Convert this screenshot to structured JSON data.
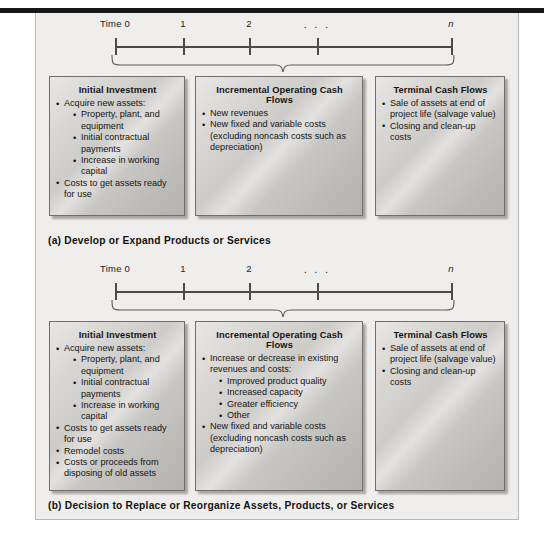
{
  "figure": {
    "timeline": {
      "ticks": [
        {
          "label": "Time 0",
          "x": 114,
          "italic": false,
          "dots": false
        },
        {
          "label": "1",
          "x": 182,
          "italic": false,
          "dots": false
        },
        {
          "label": "2",
          "x": 248,
          "italic": false,
          "dots": false
        },
        {
          "label": ". . .",
          "x": 316,
          "italic": false,
          "dots": true
        },
        {
          "label": "n",
          "x": 450,
          "italic": true,
          "dots": false
        }
      ]
    },
    "panels": [
      {
        "id": "a",
        "caption": "(a) Develop or Expand Products or Services",
        "boxes": [
          {
            "name": "initial-investment",
            "title": "Initial Investment",
            "items": [
              {
                "text": "Acquire new assets:",
                "children": [
                  {
                    "text": "Property, plant, and equipment"
                  },
                  {
                    "text": "Initial contractual payments"
                  },
                  {
                    "text": "Increase in working capital"
                  }
                ]
              },
              {
                "text": "Costs to get assets ready for use"
              }
            ]
          },
          {
            "name": "incremental-operating-cash-flows",
            "title": "Incremental Operating Cash Flows",
            "items": [
              {
                "text": "New revenues"
              },
              {
                "text": "New fixed and variable costs (excluding noncash costs such as depreciation)"
              }
            ]
          },
          {
            "name": "terminal-cash-flows",
            "title": "Terminal Cash Flows",
            "items": [
              {
                "text": "Sale of assets at end of project life (salvage value)"
              },
              {
                "text": "Closing and clean-up costs"
              }
            ]
          }
        ]
      },
      {
        "id": "b",
        "caption": "(b) Decision to Replace or Reorganize Assets, Products, or Services",
        "boxes": [
          {
            "name": "initial-investment",
            "title": "Initial Investment",
            "items": [
              {
                "text": "Acquire new assets:",
                "children": [
                  {
                    "text": "Property, plant, and equipment"
                  },
                  {
                    "text": "Initial contractual payments"
                  },
                  {
                    "text": "Increase in working capital"
                  }
                ]
              },
              {
                "text": "Costs to get assets ready for use"
              },
              {
                "text": "Remodel costs"
              },
              {
                "text": "Costs or proceeds from disposing of old assets"
              }
            ]
          },
          {
            "name": "incremental-operating-cash-flows",
            "title": "Incremental Operating Cash Flows",
            "items": [
              {
                "text": "Increase or decrease in existing revenues and costs:",
                "children": [
                  {
                    "text": "Improved product quality"
                  },
                  {
                    "text": "Increased capacity"
                  },
                  {
                    "text": "Greater efficiency"
                  },
                  {
                    "text": "Other"
                  }
                ]
              },
              {
                "text": "New fixed and variable costs (excluding noncash costs such as depreciation)"
              }
            ]
          },
          {
            "name": "terminal-cash-flows",
            "title": "Terminal Cash Flows",
            "items": [
              {
                "text": "Sale of assets at end of project life (salvage value)"
              },
              {
                "text": "Closing and clean-up costs"
              }
            ]
          }
        ]
      }
    ],
    "colors": {
      "page_background": "#ffffff",
      "panel_background": "#efeeec",
      "panel_border": "#b9b8b4",
      "top_rule": "#17171a",
      "box_border": "#6f6f6f",
      "box_fill_light": "#e8e7e5",
      "box_fill_dark": "#b4b3b0",
      "text": "#141414",
      "axis": "#4a4a4a"
    },
    "layout": {
      "box_geometry": [
        {
          "left": 13,
          "width": 136
        },
        {
          "left": 159,
          "width": 168
        },
        {
          "left": 339,
          "width": 130
        }
      ],
      "panel_a_box_height": 140,
      "panel_b_box_height": 170,
      "caption_a_top": 222,
      "caption_b_top": 487
    }
  }
}
